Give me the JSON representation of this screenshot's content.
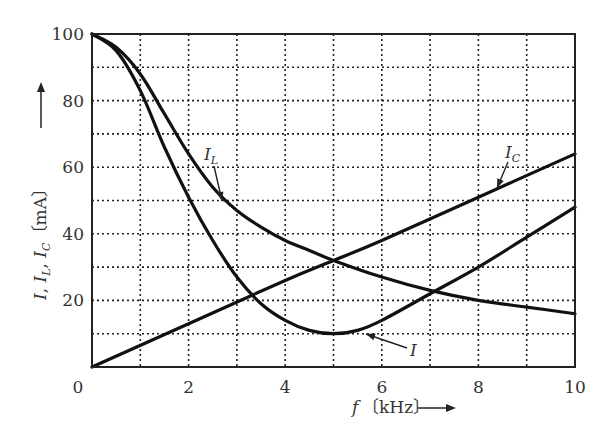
{
  "chart_data": {
    "type": "line",
    "title": "",
    "xlabel": "f [kHz]",
    "ylabel": "I, I_L, I_C [mA]",
    "xlim": [
      0,
      10
    ],
    "ylim": [
      0,
      100
    ],
    "x_ticks": [
      "0",
      "2",
      "4",
      "6",
      "8",
      "10"
    ],
    "y_ticks": [
      "0",
      "20",
      "40",
      "60",
      "80",
      "100"
    ],
    "grid": true,
    "grid_style": "dotted",
    "x_minor_grid_step": 1,
    "y_minor_grid_step": 10,
    "legend": "inline annotations with arrows",
    "series": [
      {
        "name": "I_L",
        "label": "I_L",
        "x": [
          0,
          0.5,
          1,
          1.5,
          2,
          2.5,
          3,
          3.5,
          4,
          4.5,
          5,
          6,
          7,
          8,
          9,
          10
        ],
        "y": [
          100,
          96,
          88,
          76,
          64,
          54,
          47,
          42,
          38,
          35,
          32,
          27,
          23,
          20,
          18,
          16
        ]
      },
      {
        "name": "I_C",
        "label": "I_C",
        "x": [
          0,
          2,
          4,
          5,
          6,
          8,
          10
        ],
        "y": [
          0,
          13,
          26,
          32,
          38,
          51,
          64
        ]
      },
      {
        "name": "I",
        "label": "I",
        "x": [
          0,
          0.5,
          1,
          1.5,
          2,
          2.5,
          3,
          3.5,
          4,
          4.5,
          5,
          5.5,
          6,
          7,
          8,
          9,
          10
        ],
        "y": [
          100,
          95,
          83,
          66,
          51,
          38,
          27,
          19,
          14,
          11,
          10,
          11,
          14,
          22,
          30,
          39,
          48
        ]
      }
    ],
    "annotations": [
      {
        "text": "I_L",
        "arrow_to": [
          2.7,
          50
        ]
      },
      {
        "text": "I_C",
        "arrow_to": [
          8.4,
          53
        ]
      },
      {
        "text": "I",
        "arrow_to": [
          5.7,
          12
        ]
      }
    ]
  },
  "axes": {
    "x_label_main": "f",
    "x_label_unit": "〔kHz〕",
    "y_label_parts": [
      "I",
      "I",
      "L",
      "I",
      "C",
      "〔mA〕"
    ]
  }
}
